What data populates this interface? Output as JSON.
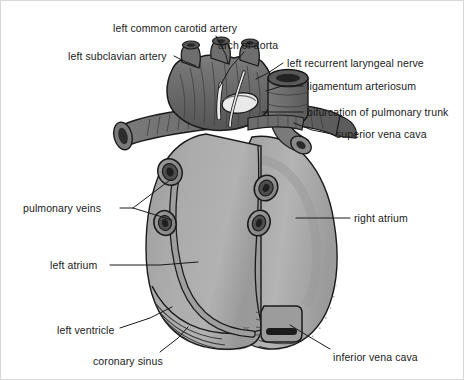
{
  "figure": {
    "background_color": "#ffffff",
    "frame_color": "#d8d8d8"
  },
  "palette": {
    "heart_body": "#a8a8a8",
    "heart_body_light": "#b6b6b6",
    "heart_body_shadow": "#989898",
    "vessel_dark": "#6a6a6a",
    "vessel_dark_shadow": "#565656",
    "vessel_mid": "#8e8e8e",
    "lumen_dark": "#2d2d2d",
    "lumen_light": "#f0f0f0",
    "outline": "#1a1a1a",
    "label_text": "#1a1a1a",
    "leader_line": "#1a1a1a"
  },
  "labels": [
    {
      "id": "left-common-carotid-artery",
      "text": "left common carotid artery",
      "align": "center",
      "x": 113,
      "y": 22,
      "leader": [
        [
          216,
          36
        ],
        [
          226,
          55
        ],
        [
          228,
          64
        ]
      ]
    },
    {
      "id": "arch-of-aorta",
      "text": "arch of aorta",
      "align": "left",
      "x": 218,
      "y": 39,
      "leader": [
        [
          244,
          52
        ],
        [
          230,
          68
        ],
        [
          219,
          88
        ]
      ]
    },
    {
      "id": "left-subclavian-artery",
      "text": "left subclavian artery",
      "align": "left",
      "x": 68,
      "y": 50,
      "leader": [
        [
          174,
          56
        ],
        [
          186,
          62
        ],
        [
          196,
          66
        ]
      ]
    },
    {
      "id": "left-recurrent-laryngeal-nerve",
      "text": "left recurrent laryngeal nerve",
      "align": "left",
      "x": 287,
      "y": 57,
      "leader": [
        [
          283,
          63
        ],
        [
          268,
          73
        ],
        [
          256,
          79
        ]
      ]
    },
    {
      "id": "ligamentum-arteriosum",
      "text": "ligamentum arteriosum",
      "align": "left",
      "x": 307,
      "y": 80,
      "leader": [
        [
          303,
          86
        ],
        [
          282,
          86
        ],
        [
          266,
          91
        ]
      ]
    },
    {
      "id": "bifurcation-of-pulmonary-trunk",
      "text": "bifurcation of pulmonary trunk",
      "align": "left",
      "x": 307,
      "y": 106,
      "leader": [
        [
          303,
          112
        ],
        [
          283,
          112
        ],
        [
          262,
          112
        ]
      ]
    },
    {
      "id": "superior-vena-cava",
      "text": "superior vena cava",
      "align": "left",
      "x": 336,
      "y": 128,
      "leader": [
        [
          332,
          134
        ],
        [
          312,
          130
        ],
        [
          294,
          123
        ]
      ]
    },
    {
      "id": "pulmonary-veins",
      "text": "pulmonary veins",
      "align": "left",
      "x": 23,
      "y": 202,
      "leader": [
        [
          120,
          208
        ],
        [
          133,
          208
        ]
      ],
      "leader2": [
        [
          133,
          208
        ],
        [
          170,
          180
        ]
      ],
      "leader3": [
        [
          133,
          208
        ],
        [
          172,
          220
        ]
      ]
    },
    {
      "id": "right-atrium",
      "text": "right atrium",
      "align": "left",
      "x": 354,
      "y": 212,
      "leader": [
        [
          350,
          218
        ],
        [
          322,
          218
        ],
        [
          296,
          218
        ]
      ]
    },
    {
      "id": "left-atrium",
      "text": "left atrium",
      "align": "left",
      "x": 50,
      "y": 259,
      "leader": [
        [
          110,
          265
        ],
        [
          160,
          265
        ],
        [
          198,
          262
        ]
      ]
    },
    {
      "id": "left-ventricle",
      "text": "left ventricle",
      "align": "left",
      "x": 57,
      "y": 324,
      "leader": [
        [
          120,
          328
        ],
        [
          150,
          318
        ],
        [
          172,
          307
        ]
      ]
    },
    {
      "id": "coronary-sinus",
      "text": "coronary sinus",
      "align": "left",
      "x": 93,
      "y": 355,
      "leader": [
        [
          160,
          352
        ],
        [
          178,
          338
        ],
        [
          188,
          327
        ]
      ]
    },
    {
      "id": "inferior-vena-cava",
      "text": "inferior vena cava",
      "align": "left",
      "x": 333,
      "y": 351,
      "leader": [
        [
          330,
          349
        ],
        [
          308,
          336
        ],
        [
          290,
          325
        ]
      ]
    }
  ],
  "structures": [
    {
      "id": "aortic-arch",
      "name": "arch of aorta"
    },
    {
      "id": "left-subclavian-artery-stump",
      "name": "left subclavian artery"
    },
    {
      "id": "left-common-carotid-stump",
      "name": "left common carotid artery"
    },
    {
      "id": "brachiocephalic-stump",
      "name": "brachiocephalic trunk"
    },
    {
      "id": "descending-aorta",
      "name": "descending aorta"
    },
    {
      "id": "superior-vena-cava-trunk",
      "name": "superior vena cava"
    },
    {
      "id": "pulmonary-trunk-bifurcation",
      "name": "bifurcation of pulmonary trunk"
    },
    {
      "id": "ligamentum-arteriosum-band",
      "name": "ligamentum arteriosum"
    },
    {
      "id": "left-recurrent-laryngeal-nerve-cord",
      "name": "left recurrent laryngeal nerve"
    },
    {
      "id": "left-atrium-body",
      "name": "left atrium"
    },
    {
      "id": "right-atrium-body",
      "name": "right atrium"
    },
    {
      "id": "left-ventricle-body",
      "name": "left ventricle"
    },
    {
      "id": "coronary-sinus-vessel",
      "name": "coronary sinus"
    },
    {
      "id": "pulmonary-vein-stump-upper-left",
      "name": "left superior pulmonary vein"
    },
    {
      "id": "pulmonary-vein-stump-lower-left",
      "name": "left inferior pulmonary vein"
    },
    {
      "id": "pulmonary-vein-stump-upper-right",
      "name": "right superior pulmonary vein"
    },
    {
      "id": "pulmonary-vein-stump-lower-right",
      "name": "right inferior pulmonary vein"
    },
    {
      "id": "inferior-vena-cava-stump",
      "name": "inferior vena cava"
    }
  ]
}
